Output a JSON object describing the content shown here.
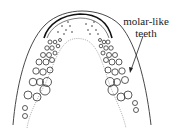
{
  "figure": {
    "annotation": {
      "line1": "molar-like",
      "line2": "teeth"
    },
    "colors": {
      "outline": "#333333",
      "inner_outline": "#888888",
      "background": "#ffffff"
    }
  }
}
